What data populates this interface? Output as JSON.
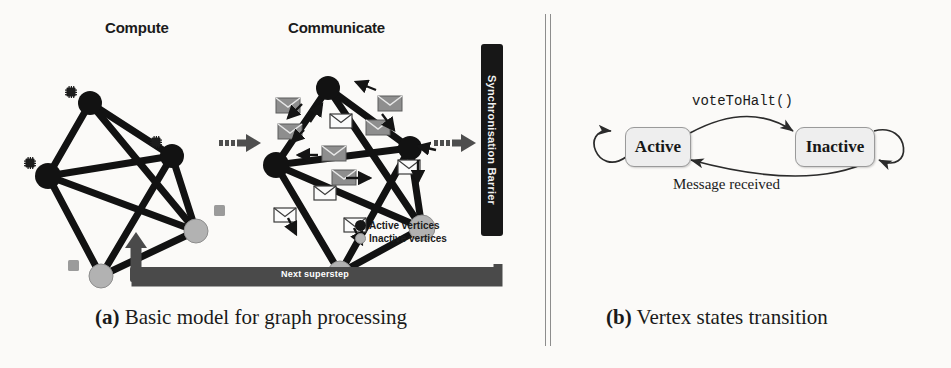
{
  "figure": {
    "background_color": "#fbfaf8",
    "ink_color": "#1a1a1a"
  },
  "panel_a": {
    "caption_prefix": "(a)",
    "caption_text": "Basic model for graph processing",
    "stage_titles": {
      "compute": "Compute",
      "communicate": "Communicate"
    },
    "sync_barrier_label": "Synchronisation Barrier",
    "superstep_label": "Next superstep",
    "legend": [
      {
        "label": "Active vertices",
        "color": "#161616",
        "icon": "filled-circle-icon"
      },
      {
        "label": "Inactive vertices",
        "color": "#b4b4b4",
        "icon": "filled-circle-icon"
      }
    ],
    "graph": {
      "vertex_count": 5,
      "active_vertex_count": 3,
      "inactive_vertex_count": 2,
      "edge_count": 9,
      "compute_vertices": [
        {
          "id": "v1",
          "x": 72,
          "y": 65,
          "state": "active",
          "r": 11
        },
        {
          "id": "v2",
          "x": 30,
          "y": 138,
          "state": "active",
          "r": 12
        },
        {
          "id": "v3",
          "x": 154,
          "y": 118,
          "state": "active",
          "r": 11
        },
        {
          "id": "v4",
          "x": 178,
          "y": 193,
          "state": "inactive",
          "r": 11
        },
        {
          "id": "v5",
          "x": 83,
          "y": 238,
          "state": "inactive",
          "r": 11
        }
      ],
      "compute_edges": [
        [
          "v1",
          "v2"
        ],
        [
          "v1",
          "v3"
        ],
        [
          "v1",
          "v4"
        ],
        [
          "v2",
          "v3"
        ],
        [
          "v2",
          "v4"
        ],
        [
          "v2",
          "v5"
        ],
        [
          "v3",
          "v4"
        ],
        [
          "v3",
          "v5"
        ],
        [
          "v4",
          "v5"
        ]
      ],
      "communicate_vertices": [
        {
          "id": "w1",
          "x": 70,
          "y": 50,
          "state": "active",
          "r": 11
        },
        {
          "id": "w2",
          "x": 18,
          "y": 127,
          "state": "active",
          "r": 12
        },
        {
          "id": "w3",
          "x": 152,
          "y": 110,
          "state": "active",
          "r": 11
        },
        {
          "id": "w4",
          "x": 164,
          "y": 190,
          "state": "inactive",
          "r": 12
        },
        {
          "id": "w5",
          "x": 82,
          "y": 235,
          "state": "inactive",
          "r": 11
        }
      ],
      "communicate_edges": [
        [
          "w1",
          "w2"
        ],
        [
          "w1",
          "w3"
        ],
        [
          "w1",
          "w4"
        ],
        [
          "w2",
          "w3"
        ],
        [
          "w2",
          "w4"
        ],
        [
          "w2",
          "w5"
        ],
        [
          "w3",
          "w4"
        ],
        [
          "w3",
          "w5"
        ],
        [
          "w4",
          "w5"
        ]
      ],
      "compute_icon": "cpu-chip-icon",
      "message_icon": "envelope-icon",
      "transition_arrow_icon": "dotted-arrow-right-icon"
    }
  },
  "panel_b": {
    "caption_prefix": "(b)",
    "caption_text": "Vertex states transition",
    "states": [
      {
        "id": "active",
        "label": "Active",
        "fill": "#eeeeee",
        "stroke": "#9a9a9a"
      },
      {
        "id": "inactive",
        "label": "Inactive",
        "fill": "#eeeeee",
        "stroke": "#9a9a9a"
      }
    ],
    "transitions": [
      {
        "from": "active",
        "to": "inactive",
        "label": "voteToHalt()",
        "label_font": "mono"
      },
      {
        "from": "inactive",
        "to": "active",
        "label": "Message received",
        "label_font": "serif"
      },
      {
        "from": "active",
        "to": "active",
        "label": "",
        "label_font": "none"
      },
      {
        "from": "inactive",
        "to": "inactive",
        "label": "",
        "label_font": "none"
      }
    ]
  }
}
